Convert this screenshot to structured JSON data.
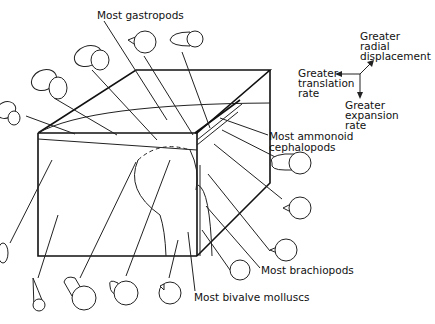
{
  "diagram": {
    "type": "3D block diagram of shell coiling parameter space",
    "labels": {
      "gastropods": "Most gastropods",
      "ammonoids_line1": "Most ammonoid",
      "ammonoids_line2": "cephalopods",
      "brachiopods": "Most brachiopods",
      "bivalves": "Most bivalve molluscs"
    },
    "axes_legend": {
      "radial": [
        "Greater",
        "radial",
        "displacement"
      ],
      "translation": [
        "Greater",
        "translation",
        "rate"
      ],
      "expansion": [
        "Greater",
        "expansion",
        "rate"
      ]
    },
    "colors": {
      "line": "#222222",
      "background": "#ffffff"
    }
  }
}
